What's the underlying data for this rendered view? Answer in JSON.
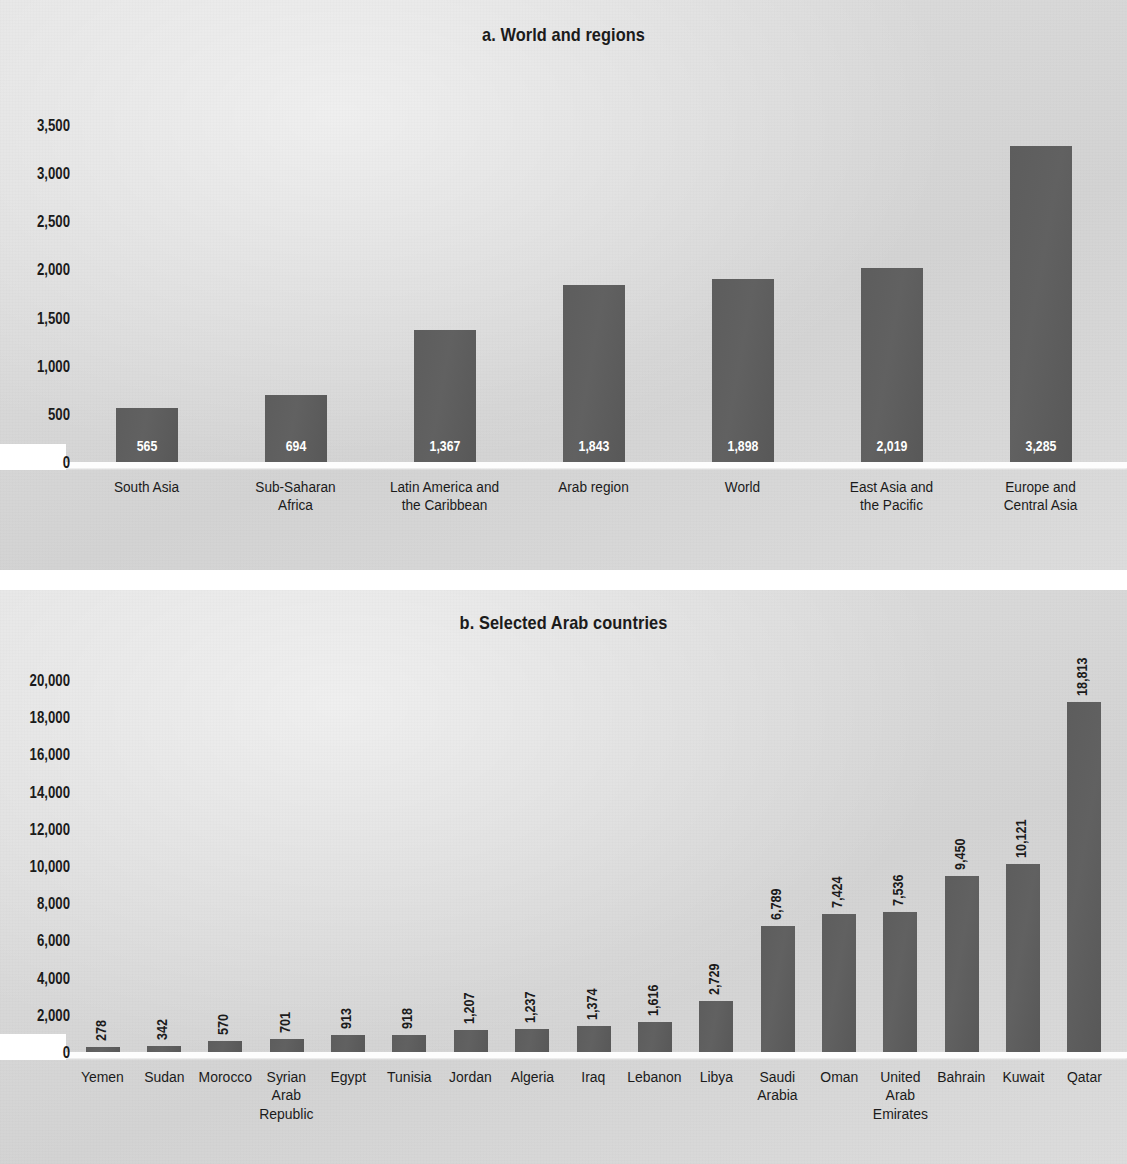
{
  "figure": {
    "background_color": "#d8d8d8",
    "bar_color": "#5e5e5e",
    "text_color": "#1b1b1b",
    "inbar_label_color": "#ffffff"
  },
  "panel_a": {
    "title": "a. World and regions",
    "yticks": [
      "3,500",
      "3,000",
      "2,500",
      "2,000",
      "1,500",
      "1,000",
      "500",
      "0"
    ],
    "zero_label": "0"
  },
  "panel_b": {
    "title": "b. Selected Arab countries",
    "yticks": [
      "20,000",
      "18,000",
      "16,000",
      "14,000",
      "12,000",
      "10,000",
      "8,000",
      "6,000",
      "4,000",
      "2,000",
      "0"
    ],
    "zero_label": "0"
  },
  "chart_data": [
    {
      "type": "bar",
      "title": "a. World and regions",
      "xlabel": "",
      "ylabel": "",
      "ylim": [
        0,
        3500
      ],
      "ytick_step": 500,
      "grid": false,
      "orientation": "vertical",
      "value_label_position": "inside-bottom",
      "categories": [
        "South Asia",
        "Sub-Saharan\nAfrica",
        "Latin America and\nthe Caribbean",
        "Arab region",
        "World",
        "East Asia and\nthe Pacific",
        "Europe and\nCentral Asia"
      ],
      "values": [
        565,
        694,
        1367,
        1843,
        1898,
        2019,
        3285
      ],
      "value_labels": [
        "565",
        "694",
        "1,367",
        "1,843",
        "1,898",
        "2,019",
        "3,285"
      ]
    },
    {
      "type": "bar",
      "title": "b. Selected Arab countries",
      "xlabel": "",
      "ylabel": "",
      "ylim": [
        0,
        20000
      ],
      "ytick_step": 2000,
      "grid": false,
      "orientation": "vertical",
      "value_label_position": "above-rotated-90",
      "categories": [
        "Yemen",
        "Sudan",
        "Morocco",
        "Syrian\nArab\nRepublic",
        "Egypt",
        "Tunisia",
        "Jordan",
        "Algeria",
        "Iraq",
        "Lebanon",
        "Libya",
        "Saudi\nArabia",
        "Oman",
        "United\nArab\nEmirates",
        "Bahrain",
        "Kuwait",
        "Qatar"
      ],
      "values": [
        278,
        342,
        570,
        701,
        913,
        918,
        1207,
        1237,
        1374,
        1616,
        2729,
        6789,
        7424,
        7536,
        9450,
        10121,
        18813
      ],
      "value_labels": [
        "278",
        "342",
        "570",
        "701",
        "913",
        "918",
        "1,207",
        "1,237",
        "1,374",
        "1,616",
        "2,729",
        "6,789",
        "7,424",
        "7,536",
        "9,450",
        "10,121",
        "18,813"
      ]
    }
  ]
}
